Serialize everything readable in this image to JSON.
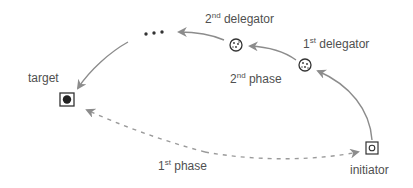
{
  "nodes": {
    "target": {
      "label": "target",
      "shape": "square-with-filled-circle"
    },
    "initiator": {
      "label": "initiator",
      "shape": "square-with-ring"
    },
    "delegator1": {
      "num": "1",
      "sup": "st",
      "word": "delegator",
      "shape": "dotted-circle"
    },
    "delegator2": {
      "num": "2",
      "sup": "nd",
      "word": "delegator",
      "shape": "dotted-circle"
    },
    "ellipsis": {
      "label": "•••"
    }
  },
  "phases": {
    "phase1": {
      "num": "1",
      "sup": "st",
      "word": "phase",
      "style": "dashed"
    },
    "phase2": {
      "num": "2",
      "sup": "nd",
      "word": "phase",
      "style": "solid"
    }
  },
  "colors": {
    "arrow": "#8c8c8c",
    "node_stroke": "#333333",
    "text": "#505050"
  }
}
